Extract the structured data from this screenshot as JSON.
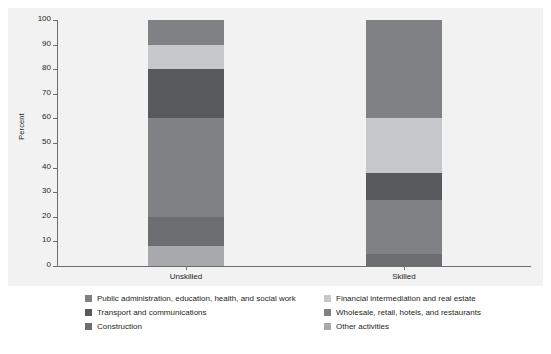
{
  "chart_data": {
    "type": "bar",
    "stacked": true,
    "title": "",
    "xlabel": "",
    "ylabel": "Percent",
    "ylim": [
      0,
      100
    ],
    "yticks": [
      0,
      10,
      20,
      30,
      40,
      50,
      60,
      70,
      80,
      90,
      100
    ],
    "categories": [
      "Unskilled",
      "Skilled"
    ],
    "grid": false,
    "legend_position": "bottom",
    "series": [
      {
        "name": "Public administration, education, health, and social work",
        "color": "#808184",
        "values": [
          10,
          40
        ]
      },
      {
        "name": "Financial intermediation and real estate",
        "color": "#c7c8ca",
        "values": [
          10,
          22
        ]
      },
      {
        "name": "Transport and communications",
        "color": "#58595b",
        "values": [
          20,
          11
        ]
      },
      {
        "name": "Wholesale, retail, hotels, and restaurants",
        "color": "#808184",
        "values": [
          40,
          22
        ]
      },
      {
        "name": "Construction",
        "color": "#6d6e71",
        "values": [
          12,
          0
        ]
      },
      {
        "name": "Other activities",
        "color": "#a7a9ac",
        "values": [
          8,
          5
        ]
      }
    ],
    "stacks": {
      "Unskilled": [
        {
          "label": "Other activities",
          "color": "#a7a9ac",
          "from": 0,
          "to": 8
        },
        {
          "label": "Construction",
          "color": "#6d6e71",
          "from": 8,
          "to": 20
        },
        {
          "label": "Wholesale, retail, hotels, and restaurants",
          "color": "#808184",
          "from": 20,
          "to": 60
        },
        {
          "label": "Transport and communications",
          "color": "#58595b",
          "from": 60,
          "to": 80
        },
        {
          "label": "Financial intermediation and real estate",
          "color": "#c7c8ca",
          "from": 80,
          "to": 90
        },
        {
          "label": "Public administration, education, health, and social work",
          "color": "#808184",
          "from": 90,
          "to": 100
        }
      ],
      "Skilled": [
        {
          "label": "Other activities",
          "color": "#6d6e71",
          "from": 0,
          "to": 5
        },
        {
          "label": "Wholesale, retail, hotels, and restaurants",
          "color": "#808184",
          "from": 5,
          "to": 27
        },
        {
          "label": "Transport and communications",
          "color": "#58595b",
          "from": 27,
          "to": 38
        },
        {
          "label": "Financial intermediation and real estate",
          "color": "#c7c8ca",
          "from": 38,
          "to": 60
        },
        {
          "label": "Public administration, education, health, and social work",
          "color": "#808184",
          "from": 60,
          "to": 100
        }
      ]
    }
  },
  "axis": {
    "y_title": "Percent",
    "y_ticks": [
      "100",
      "90",
      "80",
      "70",
      "60",
      "50",
      "40",
      "30",
      "20",
      "10",
      "0"
    ],
    "x_labels": [
      "Unskilled",
      "Skilled"
    ]
  },
  "legend": {
    "left_column": [
      {
        "label": "Public administration, education, health, and social work",
        "color": "#808184"
      },
      {
        "label": "Transport and communications",
        "color": "#58595b"
      },
      {
        "label": "Construction",
        "color": "#6d6e71"
      }
    ],
    "right_column": [
      {
        "label": "Financial intermediation and real estate",
        "color": "#c7c8ca"
      },
      {
        "label": "Wholesale, retail, hotels, and restaurants",
        "color": "#808184"
      },
      {
        "label": "Other activities",
        "color": "#a7a9ac"
      }
    ]
  },
  "colors": {
    "panel_background": "#f2f2f2",
    "axis_line": "#6d6e71",
    "text": "#231f20"
  }
}
